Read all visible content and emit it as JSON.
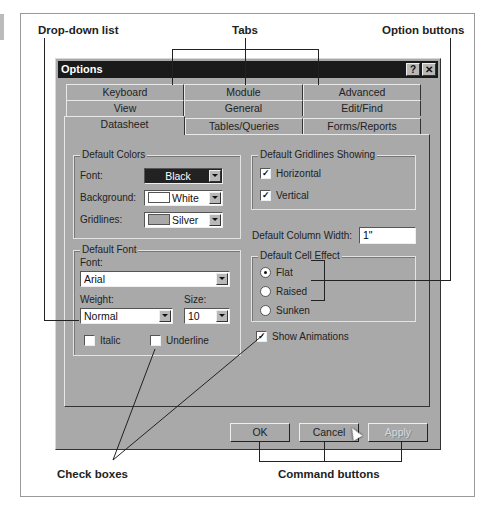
{
  "callouts": {
    "dropdown": "Drop-down list",
    "tabs": "Tabs",
    "option_buttons": "Option buttons",
    "check_boxes": "Check  boxes",
    "command_buttons": "Command buttons"
  },
  "dialog": {
    "title": "Options",
    "help_button": "?",
    "close_button": "✕",
    "tabs_row1": [
      "Keyboard",
      "Module",
      "Advanced"
    ],
    "tabs_row2": [
      "View",
      "General",
      "Edit/Find"
    ],
    "tabs_row3": [
      "Datasheet",
      "Tables/Queries",
      "Forms/Reports"
    ],
    "active_tab": "Datasheet",
    "default_colors": {
      "title": "Default Colors",
      "font_label": "Font:",
      "font_value": "Black",
      "background_label": "Background:",
      "background_value": "White",
      "gridlines_label": "Gridlines:",
      "gridlines_value": "Silver"
    },
    "default_font": {
      "title": "Default Font",
      "font_label": "Font:",
      "font_value": "Arial",
      "weight_label": "Weight:",
      "weight_value": "Normal",
      "size_label": "Size:",
      "size_value": "10",
      "italic_label": "Italic",
      "italic_checked": false,
      "underline_label": "Underline",
      "underline_checked": false
    },
    "gridlines": {
      "title": "Default Gridlines Showing",
      "horizontal_label": "Horizontal",
      "horizontal_checked": true,
      "vertical_label": "Vertical",
      "vertical_checked": true
    },
    "column_width": {
      "label": "Default Column Width:",
      "value": "1\""
    },
    "cell_effect": {
      "title": "Default Cell Effect",
      "options": [
        "Flat",
        "Raised",
        "Sunken"
      ],
      "selected": "Flat"
    },
    "show_animations": {
      "label": "Show Animations",
      "checked": true
    },
    "buttons": {
      "ok": "OK",
      "cancel": "Cancel",
      "apply": "Apply"
    },
    "check_mark": "✓"
  }
}
